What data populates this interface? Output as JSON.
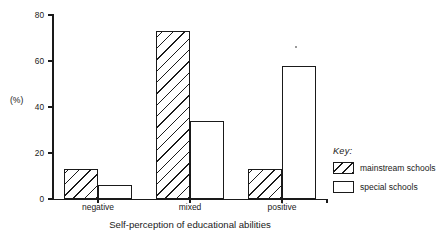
{
  "chart_data": {
    "type": "bar",
    "title": "",
    "xlabel": "Self-perception of educational abilities",
    "ylabel": "(%)",
    "categories": [
      "negative",
      "mixed",
      "positive"
    ],
    "series": [
      {
        "name": "mainstream schools",
        "values": [
          13,
          73,
          13
        ],
        "fill": "hatched"
      },
      {
        "name": "special schools",
        "values": [
          6,
          34,
          58
        ],
        "fill": "white"
      }
    ],
    "ylim": [
      0,
      80
    ],
    "yticks": [
      0,
      20,
      40,
      60,
      80
    ],
    "ytick_labels": [
      "0",
      "20",
      "40",
      "60",
      "80"
    ],
    "grid": false,
    "legend_position": "right",
    "legend_title": "Key:",
    "colors": {
      "ink": "#1a1a1a",
      "background": "#ffffff"
    }
  },
  "legend": {
    "title": "Key:",
    "entries": [
      {
        "label": "mainstream schools",
        "swatch": "hatched-swatch"
      },
      {
        "label": "special schools",
        "swatch": "white-swatch"
      }
    ]
  }
}
